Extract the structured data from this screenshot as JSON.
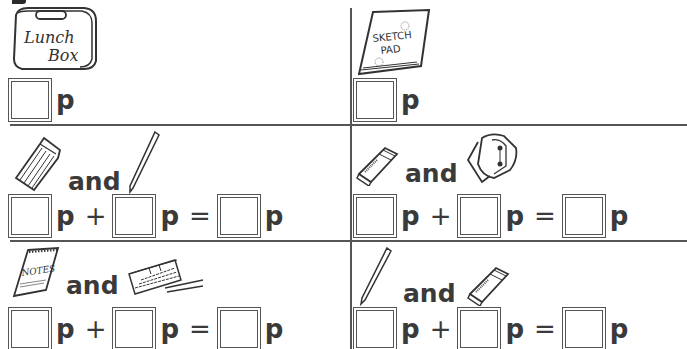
{
  "worksheet": {
    "unit": "p",
    "and_label": "and",
    "plus": "+",
    "equals": "=",
    "cells": [
      {
        "id": "lunch-box",
        "items": [
          "lunch box"
        ],
        "lunch_box_text_1": "Lunch",
        "lunch_box_text_2": "Box",
        "equation": "single"
      },
      {
        "id": "sketch-pad",
        "items": [
          "sketch pad"
        ],
        "sketch_text_1": "SKETCH",
        "sketch_text_2": "PAD",
        "equation": "single"
      },
      {
        "id": "paintbrush-and-pencil",
        "items": [
          "paintbrush",
          "pencil"
        ],
        "equation": "sum"
      },
      {
        "id": "eraser-and-sharpener",
        "items": [
          "eraser",
          "pencil sharpener"
        ],
        "equation": "sum"
      },
      {
        "id": "notes-and-paint-set",
        "items": [
          "notepad",
          "paint set"
        ],
        "notes_text": "NOTES",
        "equation": "sum"
      },
      {
        "id": "pencil-and-eraser",
        "items": [
          "pencil",
          "eraser"
        ],
        "equation": "sum"
      }
    ]
  }
}
